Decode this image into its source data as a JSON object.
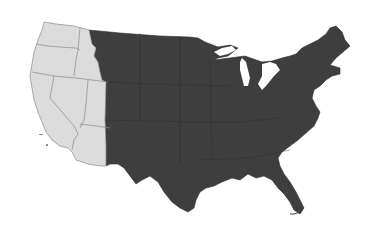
{
  "map": {
    "title": "Contiguous United States - western states highlighted",
    "colors": {
      "background": "#ffffff",
      "west_fill": "#dcdcdc",
      "east_fill": "#3e3e3e",
      "border": "#8a8a8a",
      "east_border": "#2a2a2a",
      "water": "#ffffff"
    },
    "regions": [
      {
        "name": "West",
        "fill_key": "light",
        "states": [
          "Washington",
          "Oregon",
          "California",
          "Nevada",
          "Idaho",
          "Utah",
          "Arizona"
        ]
      },
      {
        "name": "Rest of contiguous US",
        "fill_key": "dark",
        "states": [
          "Montana",
          "Wyoming",
          "Colorado",
          "New Mexico",
          "Texas",
          "and all states east"
        ]
      }
    ]
  }
}
